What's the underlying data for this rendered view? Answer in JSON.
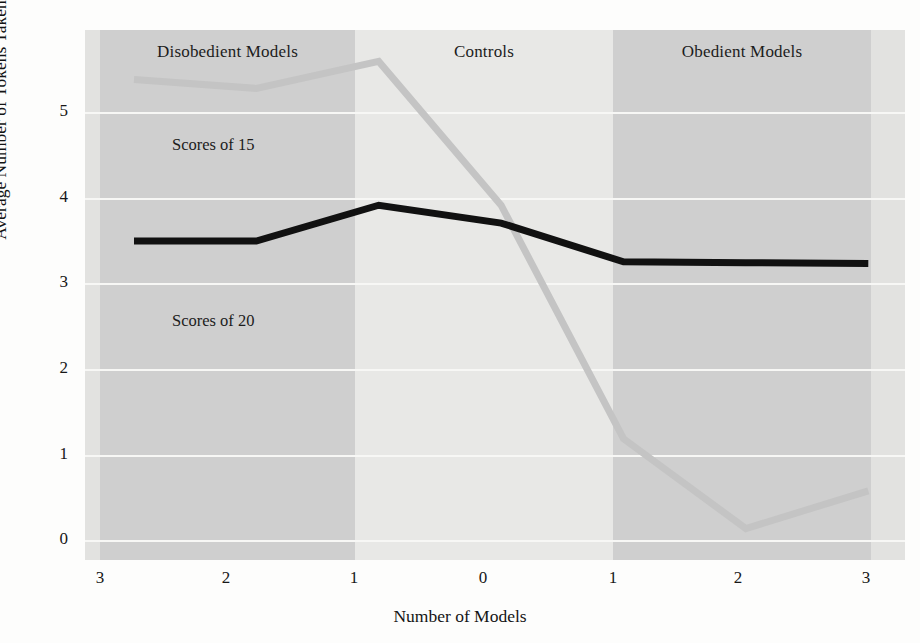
{
  "chart_data": {
    "type": "line",
    "title": "",
    "xlabel": "Number of Models",
    "ylabel": "Average Number of Tokens Taken",
    "x": [
      -3,
      -2,
      -1,
      0,
      1,
      2,
      3
    ],
    "xtick_labels": [
      "3",
      "2",
      "1",
      "0",
      "1",
      "2",
      "3"
    ],
    "ytick_labels": [
      "0",
      "1",
      "2",
      "3",
      "4",
      "5"
    ],
    "ytick_values": [
      0,
      1,
      2,
      3,
      4,
      5
    ],
    "ylim": [
      -0.35,
      5.55
    ],
    "xlim": [
      -3.4,
      3.3
    ],
    "grid": "horizontal",
    "legend_position": "inline-annotations",
    "series": [
      {
        "name": "Scores of 15",
        "color": "#c4c4c4",
        "values": [
          5.0,
          4.9,
          5.2,
          3.6,
          1.0,
          0.0,
          0.42
        ]
      },
      {
        "name": "Scores of 20",
        "color": "#111111",
        "values": [
          3.2,
          3.2,
          3.6,
          3.4,
          2.97,
          2.96,
          2.95
        ]
      }
    ],
    "annotations": [
      {
        "text": "Scores of 15",
        "x": -2.0,
        "y": 4.55
      },
      {
        "text": "Scores of 20",
        "x": -2.0,
        "y": 2.55
      }
    ],
    "bands": [
      {
        "label": "Disobedient Models",
        "x_start": -3,
        "x_end": -1,
        "shade": "dark"
      },
      {
        "label": "Controls",
        "x_start": -1,
        "x_end": 1,
        "shade": "light"
      },
      {
        "label": "Obedient Models",
        "x_start": 1,
        "x_end": 3,
        "shade": "dark"
      }
    ]
  },
  "axes": {
    "y_title": "Average Number of Tokens Taken",
    "x_title": "Number of Models",
    "y_ticks": [
      "5",
      "4",
      "3",
      "2",
      "1",
      "0"
    ],
    "x_ticks": [
      "3",
      "2",
      "1",
      "0",
      "1",
      "2",
      "3"
    ]
  },
  "bands": {
    "disobedient": "Disobedient Models",
    "controls": "Controls",
    "obedient": "Obedient Models"
  },
  "series_labels": {
    "scores_15": "Scores of 15",
    "scores_20": "Scores of 20"
  },
  "colors": {
    "series_light": "#c4c4c4",
    "series_dark": "#111111",
    "band_dark": "#cfcfcf",
    "band_light": "#e8e8e6",
    "gridline": "#f7f7f5",
    "background": "#fdfdfc"
  }
}
